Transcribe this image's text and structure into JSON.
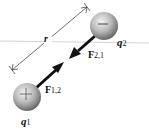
{
  "diagram": {
    "distance_label": "r",
    "charges": [
      {
        "name": "q",
        "subscript": "1",
        "sign": "+",
        "center": [
          27,
          97
        ],
        "radius": 14
      },
      {
        "name": "q",
        "subscript": "2",
        "sign": "−",
        "center": [
          104,
          26
        ],
        "radius": 14
      }
    ],
    "forces": [
      {
        "name": "F",
        "subscript": "1,2",
        "on": "q1 toward q2"
      },
      {
        "name": "F",
        "subscript": "2,1",
        "on": "q2 toward q1"
      }
    ],
    "colors": {
      "sphere_light": "#f2f2f2",
      "sphere_mid": "#b5b5b5",
      "sphere_dark": "#6e6e6e",
      "arrow": "#111111",
      "baseline": "#c8c8c8",
      "dimension_line": "#333333"
    }
  }
}
